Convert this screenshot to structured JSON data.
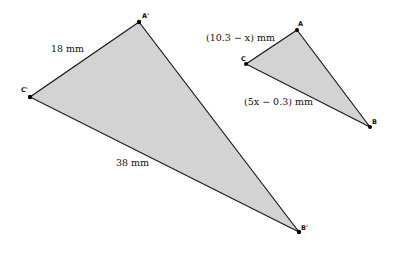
{
  "diagram": {
    "fill_color": "#d3d3d3",
    "stroke_color": "#1a1a1a",
    "large_triangle": {
      "vertices": {
        "A_prime": {
          "label": "A'",
          "x": 139,
          "y": 22
        },
        "C_prime": {
          "label": "C'",
          "x": 30,
          "y": 97
        },
        "B_prime": {
          "label": "B'",
          "x": 299,
          "y": 232
        }
      },
      "sides": {
        "A_prime_C_prime": "18 mm",
        "C_prime_B_prime": "38 mm"
      }
    },
    "small_triangle": {
      "vertices": {
        "A": {
          "label": "A",
          "x": 297,
          "y": 30
        },
        "C": {
          "label": "C",
          "x": 246,
          "y": 64
        },
        "B": {
          "label": "B",
          "x": 370,
          "y": 127
        }
      },
      "sides": {
        "A_C": "(10.3 − x) mm",
        "C_B": "(5x − 0.3) mm"
      }
    }
  }
}
